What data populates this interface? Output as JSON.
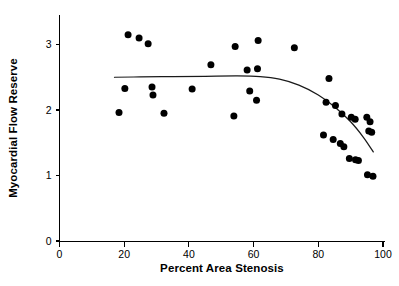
{
  "chart_data": {
    "type": "scatter",
    "title": "",
    "xlabel": "Percent Area Stenosis",
    "ylabel": "Myocardial Flow Reserve",
    "xlim": [
      0,
      100
    ],
    "ylim": [
      0,
      3.4
    ],
    "xticks": [
      0,
      20,
      40,
      60,
      80,
      100
    ],
    "xticklabels": [
      "0",
      "20",
      "40",
      "60",
      "80",
      "100"
    ],
    "yticks": [
      0,
      1,
      2,
      3
    ],
    "yticklabels": [
      "0",
      "1",
      "2",
      "3"
    ],
    "grid": false,
    "legend": null,
    "marker": "filled-circle",
    "marker_color": "#000000",
    "series": [
      {
        "name": "Patients",
        "points": [
          {
            "x": 18.4,
            "y": 1.96
          },
          {
            "x": 20.2,
            "y": 2.33
          },
          {
            "x": 21.2,
            "y": 3.15
          },
          {
            "x": 24.6,
            "y": 3.1
          },
          {
            "x": 27.4,
            "y": 3.01
          },
          {
            "x": 28.6,
            "y": 2.35
          },
          {
            "x": 28.9,
            "y": 2.23
          },
          {
            "x": 32.3,
            "y": 1.95
          },
          {
            "x": 41.0,
            "y": 2.32
          },
          {
            "x": 46.8,
            "y": 2.69
          },
          {
            "x": 53.9,
            "y": 1.91
          },
          {
            "x": 54.3,
            "y": 2.97
          },
          {
            "x": 58.0,
            "y": 2.61
          },
          {
            "x": 58.8,
            "y": 2.29
          },
          {
            "x": 60.9,
            "y": 2.15
          },
          {
            "x": 61.2,
            "y": 2.63
          },
          {
            "x": 61.4,
            "y": 3.06
          },
          {
            "x": 72.6,
            "y": 2.95
          },
          {
            "x": 83.3,
            "y": 2.48
          },
          {
            "x": 82.4,
            "y": 2.12
          },
          {
            "x": 85.3,
            "y": 2.07
          },
          {
            "x": 87.3,
            "y": 1.94
          },
          {
            "x": 90.2,
            "y": 1.89
          },
          {
            "x": 91.4,
            "y": 1.86
          },
          {
            "x": 95.0,
            "y": 1.89
          },
          {
            "x": 96.0,
            "y": 1.82
          },
          {
            "x": 95.6,
            "y": 1.68
          },
          {
            "x": 96.5,
            "y": 1.66
          },
          {
            "x": 81.6,
            "y": 1.62
          },
          {
            "x": 84.6,
            "y": 1.55
          },
          {
            "x": 86.8,
            "y": 1.49
          },
          {
            "x": 87.9,
            "y": 1.44
          },
          {
            "x": 89.6,
            "y": 1.26
          },
          {
            "x": 91.5,
            "y": 1.24
          },
          {
            "x": 92.4,
            "y": 1.23
          },
          {
            "x": 95.2,
            "y": 1.01
          },
          {
            "x": 96.9,
            "y": 0.99
          }
        ]
      }
    ],
    "fit_curve": {
      "name": "fitted regression curve",
      "points": [
        {
          "x": 17.0,
          "y": 2.5
        },
        {
          "x": 25.0,
          "y": 2.505
        },
        {
          "x": 35.0,
          "y": 2.51
        },
        {
          "x": 45.0,
          "y": 2.515
        },
        {
          "x": 55.0,
          "y": 2.52
        },
        {
          "x": 62.0,
          "y": 2.51
        },
        {
          "x": 68.0,
          "y": 2.47
        },
        {
          "x": 74.0,
          "y": 2.38
        },
        {
          "x": 80.0,
          "y": 2.23
        },
        {
          "x": 85.0,
          "y": 2.05
        },
        {
          "x": 90.0,
          "y": 1.82
        },
        {
          "x": 94.0,
          "y": 1.58
        },
        {
          "x": 97.0,
          "y": 1.36
        }
      ]
    }
  },
  "figure": {
    "background_color": "#ffffff",
    "axis_color": "#000000"
  }
}
